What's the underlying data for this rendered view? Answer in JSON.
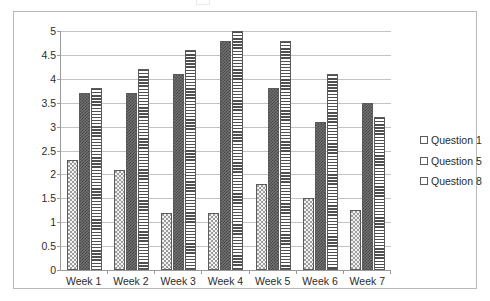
{
  "chart_data": {
    "type": "bar",
    "title": "",
    "subtitle": "",
    "xlabel": "",
    "ylabel": "",
    "categories": [
      "Week 1",
      "Week 2",
      "Week 3",
      "Week 4",
      "Week 5",
      "Week 6",
      "Week 7"
    ],
    "series": [
      {
        "name": "Question 1",
        "fill": "light-dotted",
        "color": "#f2f2f2",
        "values": [
          2.3,
          2.1,
          1.2,
          1.2,
          1.8,
          1.5,
          1.25
        ]
      },
      {
        "name": "Question 5",
        "fill": "dark-checkered",
        "color": "#6f6f6f",
        "values": [
          3.7,
          3.7,
          4.1,
          4.8,
          3.8,
          3.1,
          3.5
        ]
      },
      {
        "name": "Question 8",
        "fill": "horizontal-stripes",
        "color": "#ffffff",
        "values": [
          3.8,
          4.2,
          4.6,
          5.0,
          4.8,
          4.1,
          3.2
        ]
      }
    ],
    "ylim": [
      0,
      5
    ],
    "ystep": 0.5,
    "yticks": [
      "5",
      "4.5",
      "4",
      "3.5",
      "3",
      "2.5",
      "2",
      "1.5",
      "1",
      "0.5",
      "0"
    ],
    "ytick_values": [
      5,
      4.5,
      4,
      3.5,
      3,
      2.5,
      2,
      1.5,
      1,
      0.5,
      0
    ],
    "grid": true,
    "grid_axis": "y",
    "legend_position": "right",
    "plot_background": "#ffffff",
    "grid_color": "#c3c3c3",
    "axis_color": "#9a9a9a",
    "frame_color": "#b9b9b9"
  },
  "legend": {
    "items": [
      {
        "label": "Question 1"
      },
      {
        "label": "Question 5"
      },
      {
        "label": "Question 8"
      }
    ]
  }
}
